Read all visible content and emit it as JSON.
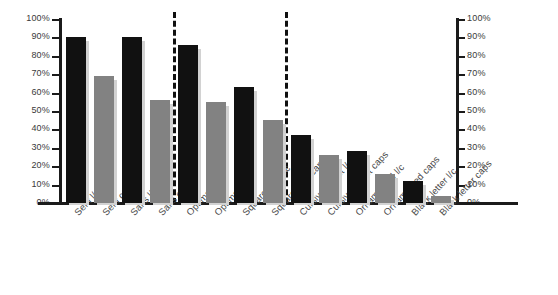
{
  "chart_data": {
    "type": "bar",
    "title": "",
    "subtitle": "",
    "xlabel": "",
    "ylabel": "",
    "ylim": [
      0,
      100
    ],
    "grid": false,
    "legend": "none",
    "y_axis_unit": "%",
    "dual_axis": true,
    "y_tick_labels": [
      "100%",
      "90%",
      "80%",
      "70%",
      "60%",
      "50%",
      "40%",
      "30%",
      "20%",
      "10%",
      "0%"
    ],
    "y_tick_values": [
      100,
      90,
      80,
      70,
      60,
      50,
      40,
      30,
      20,
      10,
      0
    ],
    "right_axis_tick_labels": [
      "100%",
      "90%",
      "80%",
      "70%",
      "60%",
      "50%",
      "40%",
      "30%",
      "20%",
      "10%",
      "0%"
    ],
    "categories": [
      "Serif l/c",
      "Serif caps",
      "Sans l/c",
      "Sans caps",
      "Optima l/c",
      "Optima caps",
      "Square serif l/c",
      "Square serif caps",
      "Cursive/Script l/c",
      "Cursive/Script caps",
      "Ornamented l/c",
      "Ornamented caps",
      "Black letter l/c",
      "Black letter caps"
    ],
    "values": [
      90,
      69,
      90,
      56,
      86,
      55,
      63,
      45,
      37,
      26,
      28,
      16,
      12,
      4
    ],
    "bar_colors": [
      "#111111",
      "#828282",
      "#111111",
      "#828282",
      "#111111",
      "#828282",
      "#111111",
      "#828282",
      "#111111",
      "#828282",
      "#111111",
      "#828282",
      "#111111",
      "#828282"
    ],
    "group_dividers_after_index": [
      3,
      7
    ],
    "groups": [
      {
        "name": "group-1",
        "categories": [
          "Serif l/c",
          "Serif caps",
          "Sans l/c",
          "Sans caps"
        ]
      },
      {
        "name": "group-2",
        "categories": [
          "Optima l/c",
          "Optima caps",
          "Square serif l/c",
          "Square serif caps"
        ]
      },
      {
        "name": "group-3",
        "categories": [
          "Cursive/Script l/c",
          "Cursive/Script caps",
          "Ornamented l/c",
          "Ornamented caps",
          "Black letter l/c",
          "Black letter caps"
        ]
      }
    ],
    "colors": {
      "black_bar": "#111111",
      "gray_bar": "#828282",
      "bar_shadow": "#d2d2d2",
      "axis": "#1b1b1b",
      "tick_text": "#3a3a3a",
      "label_text": "#4a4a4a",
      "divider": "#101010",
      "background": "#ffffff"
    }
  }
}
